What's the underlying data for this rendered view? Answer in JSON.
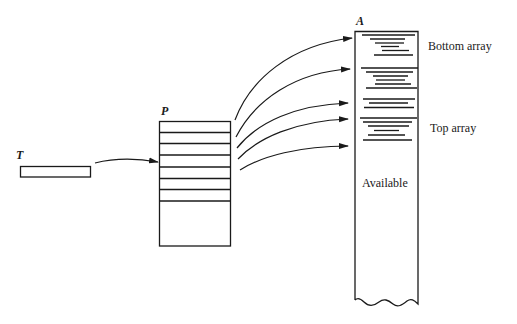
{
  "diagram": {
    "type": "memory-structure",
    "colors": {
      "ink": "#1a1a1a",
      "background": "#ffffff"
    },
    "nodes": {
      "T": {
        "label": "T",
        "shape": "thin-rectangle"
      },
      "P": {
        "label": "P",
        "shape": "stacked-cells",
        "cells": 7,
        "empty_bottom": true
      },
      "A": {
        "label": "A",
        "shape": "tall-array-torn-bottom"
      }
    },
    "regions": {
      "bottom_array": {
        "label": "Bottom array"
      },
      "top_array": {
        "label": "Top array"
      },
      "available": {
        "label": "Available"
      }
    },
    "edges": [
      {
        "from": "T",
        "to": "P.cell-4"
      },
      {
        "from": "P.cell-1",
        "to": "A.block-1"
      },
      {
        "from": "P.cell-2",
        "to": "A.block-2"
      },
      {
        "from": "P.cell-3",
        "to": "A.block-3"
      },
      {
        "from": "P.cell-4",
        "to": "A.block-4"
      },
      {
        "from": "P.cell-5",
        "to": "A.block-5"
      }
    ]
  }
}
